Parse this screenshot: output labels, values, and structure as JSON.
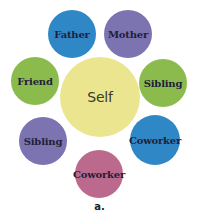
{
  "diagram": {
    "center": {
      "label": "Self",
      "color": "#ece58f"
    },
    "nodes": [
      {
        "label": "Father",
        "color": "#2f87c6"
      },
      {
        "label": "Mother",
        "color": "#7c73b1"
      },
      {
        "label": "Friend",
        "color": "#8bbb4c"
      },
      {
        "label": "Sibling",
        "color": "#8bbb4c"
      },
      {
        "label": "Sibling",
        "color": "#7c73b1"
      },
      {
        "label": "Coworker",
        "color": "#2f87c6"
      },
      {
        "label": "Coworker",
        "color": "#bb6a8d"
      }
    ],
    "caption": "a."
  }
}
